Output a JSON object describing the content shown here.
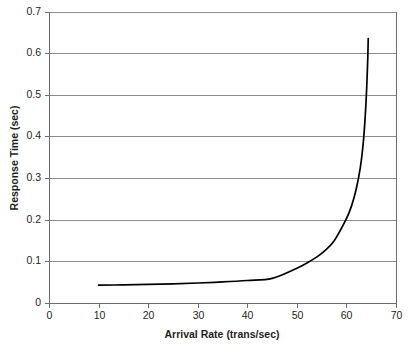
{
  "chart_data": {
    "type": "line",
    "title": "",
    "xlabel": "Arrival Rate (trans/sec)",
    "ylabel": "Response Time (sec)",
    "xlim": [
      0,
      70
    ],
    "ylim": [
      0,
      0.7
    ],
    "xticks": [
      "0",
      "10",
      "20",
      "30",
      "40",
      "50",
      "60",
      "70"
    ],
    "xtick_values": [
      0,
      10,
      20,
      30,
      40,
      50,
      60,
      70
    ],
    "yticks": [
      "0",
      "0.1",
      "0.2",
      "0.3",
      "0.4",
      "0.5",
      "0.6",
      "0.7"
    ],
    "ytick_values": [
      0,
      0.1,
      0.2,
      0.3,
      0.4,
      0.5,
      0.6,
      0.7
    ],
    "grid": "horizontal",
    "legend": "none",
    "series": [
      {
        "name": "Response Time",
        "color": "#000000",
        "x": [
          10,
          15,
          20,
          25,
          30,
          35,
          40,
          45,
          50,
          52.6,
          55,
          57.5,
          59.9,
          61,
          62,
          62.8,
          63.4,
          63.8,
          64.1,
          64.3,
          64.4
        ],
        "values": [
          0.043,
          0.0435,
          0.0445,
          0.046,
          0.048,
          0.0505,
          0.054,
          0.059,
          0.0835,
          0.1,
          0.119,
          0.149,
          0.2,
          0.232,
          0.275,
          0.325,
          0.385,
          0.45,
          0.52,
          0.585,
          0.635
        ]
      }
    ]
  },
  "axes": {
    "x_title": "Arrival Rate (trans/sec)",
    "y_title": "Response Time (sec)"
  },
  "colors": {
    "curve": "#000000",
    "grid": "#8d8d8d",
    "axis": "#6d6d6d",
    "background": "#ffffff",
    "text": "#231f20"
  }
}
